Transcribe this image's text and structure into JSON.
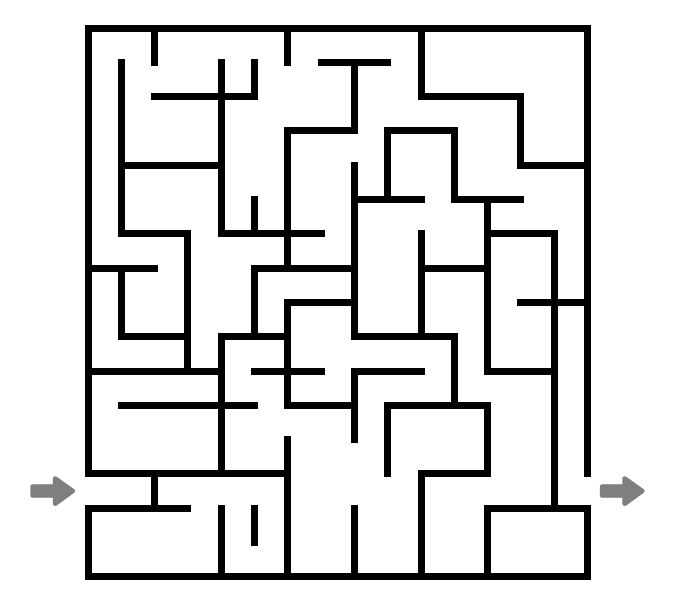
{
  "figure": {
    "kind": "maze-puzzle",
    "background_color": "#ffffff"
  },
  "maze": {
    "columns": 15,
    "rows": 16,
    "cell_width": 33.3,
    "cell_height": 34.3,
    "origin_x": 88,
    "origin_y": 28,
    "wall_color": "#000000",
    "wall_thickness": 7,
    "entrance": {
      "label": "entrance",
      "side": "left",
      "row_index": 13,
      "arrow_color": "#7f7f7f",
      "arrow_glyph": "right-arrow"
    },
    "exit": {
      "label": "exit",
      "side": "right",
      "row_index": 13,
      "arrow_color": "#7f7f7f",
      "arrow_glyph": "right-arrow"
    },
    "border_segments": [
      {
        "x1": 0,
        "y1": 0,
        "x2": 15,
        "y2": 0
      },
      {
        "x1": 0,
        "y1": 16,
        "x2": 15,
        "y2": 16
      },
      {
        "x1": 0,
        "y1": 0,
        "x2": 0,
        "y2": 13
      },
      {
        "x1": 0,
        "y1": 14,
        "x2": 0,
        "y2": 16
      },
      {
        "x1": 15,
        "y1": 0,
        "x2": 15,
        "y2": 13
      },
      {
        "x1": 15,
        "y1": 14,
        "x2": 15,
        "y2": 16
      }
    ],
    "horizontal_walls": [
      {
        "x1": 2,
        "x2": 5,
        "y": 2
      },
      {
        "x1": 7,
        "x2": 9,
        "y": 1
      },
      {
        "x1": 10,
        "x2": 13,
        "y": 2
      },
      {
        "x1": 1,
        "x2": 4,
        "y": 4
      },
      {
        "x1": 6,
        "x2": 8,
        "y": 3
      },
      {
        "x1": 9,
        "x2": 11,
        "y": 3
      },
      {
        "x1": 13,
        "x2": 15,
        "y": 4
      },
      {
        "x1": 1,
        "x2": 3,
        "y": 6
      },
      {
        "x1": 4,
        "x2": 7,
        "y": 6
      },
      {
        "x1": 8,
        "x2": 10,
        "y": 5
      },
      {
        "x1": 11,
        "x2": 13,
        "y": 5
      },
      {
        "x1": 12,
        "x2": 14,
        "y": 6
      },
      {
        "x1": 0,
        "x2": 2,
        "y": 7
      },
      {
        "x1": 5,
        "x2": 8,
        "y": 7
      },
      {
        "x1": 10,
        "x2": 12,
        "y": 7
      },
      {
        "x1": 6,
        "x2": 8,
        "y": 8
      },
      {
        "x1": 13,
        "x2": 15,
        "y": 8
      },
      {
        "x1": 1,
        "x2": 3,
        "y": 9
      },
      {
        "x1": 4,
        "x2": 6,
        "y": 9
      },
      {
        "x1": 8,
        "x2": 11,
        "y": 9
      },
      {
        "x1": 0,
        "x2": 4,
        "y": 10
      },
      {
        "x1": 5,
        "x2": 7,
        "y": 10
      },
      {
        "x1": 8,
        "x2": 10,
        "y": 10
      },
      {
        "x1": 12,
        "x2": 14,
        "y": 10
      },
      {
        "x1": 1,
        "x2": 5,
        "y": 11
      },
      {
        "x1": 6,
        "x2": 8,
        "y": 11
      },
      {
        "x1": 9,
        "x2": 12,
        "y": 11
      },
      {
        "x1": 0,
        "x2": 4,
        "y": 13
      },
      {
        "x1": 4,
        "x2": 6,
        "y": 13
      },
      {
        "x1": 10,
        "x2": 12,
        "y": 13
      },
      {
        "x1": 0,
        "x2": 3,
        "y": 14
      },
      {
        "x1": 13,
        "x2": 15,
        "y": 14
      },
      {
        "x1": 12,
        "x2": 13,
        "y": 14
      }
    ],
    "vertical_walls": [
      {
        "x": 2,
        "y1": 0,
        "y2": 1
      },
      {
        "x": 6,
        "y1": 0,
        "y2": 1
      },
      {
        "x": 10,
        "y1": 0,
        "y2": 2
      },
      {
        "x": 1,
        "y1": 1,
        "y2": 4
      },
      {
        "x": 4,
        "y1": 1,
        "y2": 2
      },
      {
        "x": 5,
        "y1": 1,
        "y2": 2
      },
      {
        "x": 8,
        "y1": 1,
        "y2": 3
      },
      {
        "x": 13,
        "y1": 2,
        "y2": 4
      },
      {
        "x": 4,
        "y1": 2,
        "y2": 6
      },
      {
        "x": 6,
        "y1": 3,
        "y2": 4
      },
      {
        "x": 11,
        "y1": 3,
        "y2": 5
      },
      {
        "x": 9,
        "y1": 3,
        "y2": 5
      },
      {
        "x": 1,
        "y1": 4,
        "y2": 6
      },
      {
        "x": 6,
        "y1": 4,
        "y2": 7
      },
      {
        "x": 8,
        "y1": 4,
        "y2": 7
      },
      {
        "x": 5,
        "y1": 5,
        "y2": 6
      },
      {
        "x": 12,
        "y1": 5,
        "y2": 7
      },
      {
        "x": 3,
        "y1": 6,
        "y2": 10
      },
      {
        "x": 10,
        "y1": 6,
        "y2": 9
      },
      {
        "x": 14,
        "y1": 6,
        "y2": 8
      },
      {
        "x": 1,
        "y1": 7,
        "y2": 9
      },
      {
        "x": 8,
        "y1": 7,
        "y2": 9
      },
      {
        "x": 5,
        "y1": 7,
        "y2": 9
      },
      {
        "x": 12,
        "y1": 7,
        "y2": 10
      },
      {
        "x": 14,
        "y1": 8,
        "y2": 12
      },
      {
        "x": 6,
        "y1": 8,
        "y2": 11
      },
      {
        "x": 4,
        "y1": 9,
        "y2": 11
      },
      {
        "x": 11,
        "y1": 9,
        "y2": 11
      },
      {
        "x": 8,
        "y1": 10,
        "y2": 12
      },
      {
        "x": 9,
        "y1": 11,
        "y2": 13
      },
      {
        "x": 4,
        "y1": 11,
        "y2": 13
      },
      {
        "x": 12,
        "y1": 11,
        "y2": 13
      },
      {
        "x": 6,
        "y1": 12,
        "y2": 14
      },
      {
        "x": 14,
        "y1": 12,
        "y2": 14
      },
      {
        "x": 2,
        "y1": 13,
        "y2": 14
      },
      {
        "x": 10,
        "y1": 13,
        "y2": 16
      },
      {
        "x": 4,
        "y1": 14,
        "y2": 16
      },
      {
        "x": 6,
        "y1": 14,
        "y2": 16
      },
      {
        "x": 8,
        "y1": 14,
        "y2": 16
      },
      {
        "x": 12,
        "y1": 14,
        "y2": 16
      },
      {
        "x": 5,
        "y1": 14,
        "y2": 15
      }
    ]
  }
}
